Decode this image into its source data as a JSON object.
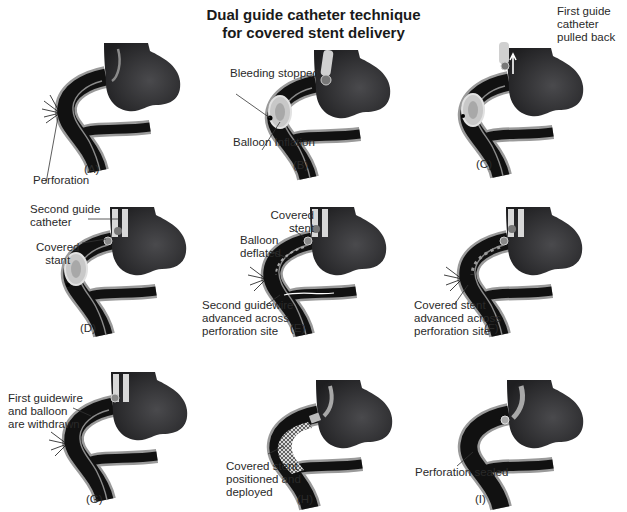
{
  "figure": {
    "title_line1": "Dual guide catheter technique",
    "title_line2": "for covered stent delivery"
  },
  "colors": {
    "aorta": "#3a3a3c",
    "vessel_lumen": "#111111",
    "vessel_wall": "#9a9a9a",
    "catheter": "#c8c8c8",
    "background": "#ffffff"
  },
  "panels": [
    {
      "id": "A",
      "caption": "(A)",
      "labels": [
        "Perforation"
      ]
    },
    {
      "id": "B",
      "caption": "(B)",
      "labels": [
        "Bleeding stopped",
        "Balloon Inflation"
      ]
    },
    {
      "id": "C",
      "caption": "(C)",
      "labels": [
        "First guide",
        "catheter",
        "pulled back"
      ]
    },
    {
      "id": "D",
      "caption": "(D)",
      "labels": [
        "Second guide",
        "catheter",
        "Covered",
        "stant"
      ]
    },
    {
      "id": "E",
      "caption": "(E)",
      "labels": [
        "Covered",
        "stent",
        "Balloon",
        "deflated",
        "Second guidewire",
        "advanced across",
        "perforation site"
      ]
    },
    {
      "id": "F",
      "caption": "(F)",
      "labels": [
        "Covered stent",
        "advanced across",
        "perforation site"
      ]
    },
    {
      "id": "G",
      "caption": "(G)",
      "labels": [
        "First guidewire",
        "and balloon",
        "are withdrawn"
      ]
    },
    {
      "id": "H",
      "caption": "(H)",
      "labels": [
        "Covered stent",
        "positioned and",
        "deployed"
      ]
    },
    {
      "id": "I",
      "caption": "(I)",
      "labels": [
        "Perforation sealed"
      ]
    }
  ]
}
